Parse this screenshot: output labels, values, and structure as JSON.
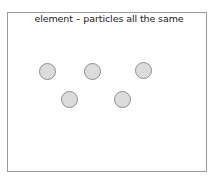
{
  "diagram": {
    "title": "element – particles all the same",
    "colors": {
      "particle_fill": "#dcdcdc",
      "particle_stroke": "#8e8e8e",
      "frame_border": "#9a9a9a"
    },
    "particles": [
      {
        "cx": 47,
        "cy": 71
      },
      {
        "cx": 92,
        "cy": 71
      },
      {
        "cx": 143,
        "cy": 70
      },
      {
        "cx": 69,
        "cy": 99
      },
      {
        "cx": 122,
        "cy": 99
      }
    ]
  }
}
